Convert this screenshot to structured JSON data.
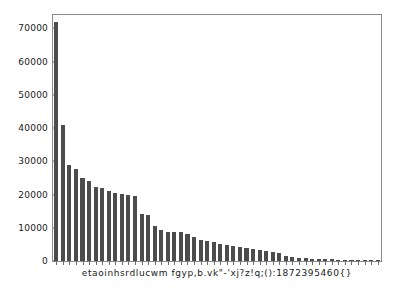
{
  "chart_data": {
    "type": "bar",
    "title": "",
    "xlabel": "",
    "ylabel": "",
    "ylim": [
      0,
      74000
    ],
    "yticks": [
      0,
      10000,
      20000,
      30000,
      40000,
      50000,
      60000,
      70000
    ],
    "ytick_labels": [
      "0",
      "10000",
      "20000",
      "30000",
      "40000",
      "50000",
      "60000",
      "70000"
    ],
    "grid": false,
    "legend": "none",
    "bar_color": "#4c4c4c",
    "frame_color": "#8c8c8c",
    "background_color": "#ffffff",
    "xtick_label_string": "etaoinhsrdlucwm fgyp,b.vk\"-'xj?z!q;():1872395460{}",
    "categories": [
      "e",
      "t",
      "a",
      "o",
      "i",
      "n",
      "h",
      "s",
      "r",
      "d",
      "l",
      "u",
      "c",
      "w",
      "m",
      " ",
      "f",
      "g",
      "y",
      "p",
      ",",
      "b",
      ".",
      "v",
      "k",
      "\"",
      "-",
      "'",
      "x",
      "j",
      "?",
      "z",
      "!",
      "q",
      ";",
      "(",
      ")",
      ":",
      "1",
      "8",
      "7",
      "2",
      "3",
      "9",
      "5",
      "4",
      "6",
      "0",
      "{",
      "}"
    ],
    "values": [
      72000,
      41000,
      28800,
      27600,
      25100,
      24000,
      22200,
      22000,
      21200,
      20500,
      20100,
      19800,
      19700,
      14200,
      13800,
      10400,
      9300,
      8800,
      8700,
      8600,
      8100,
      7300,
      6400,
      5900,
      5600,
      5200,
      4900,
      4600,
      4300,
      3900,
      3500,
      3200,
      2900,
      2700,
      2500,
      1400,
      1200,
      950,
      800,
      700,
      620,
      560,
      500,
      450,
      400,
      360,
      320,
      280,
      200,
      160
    ]
  }
}
